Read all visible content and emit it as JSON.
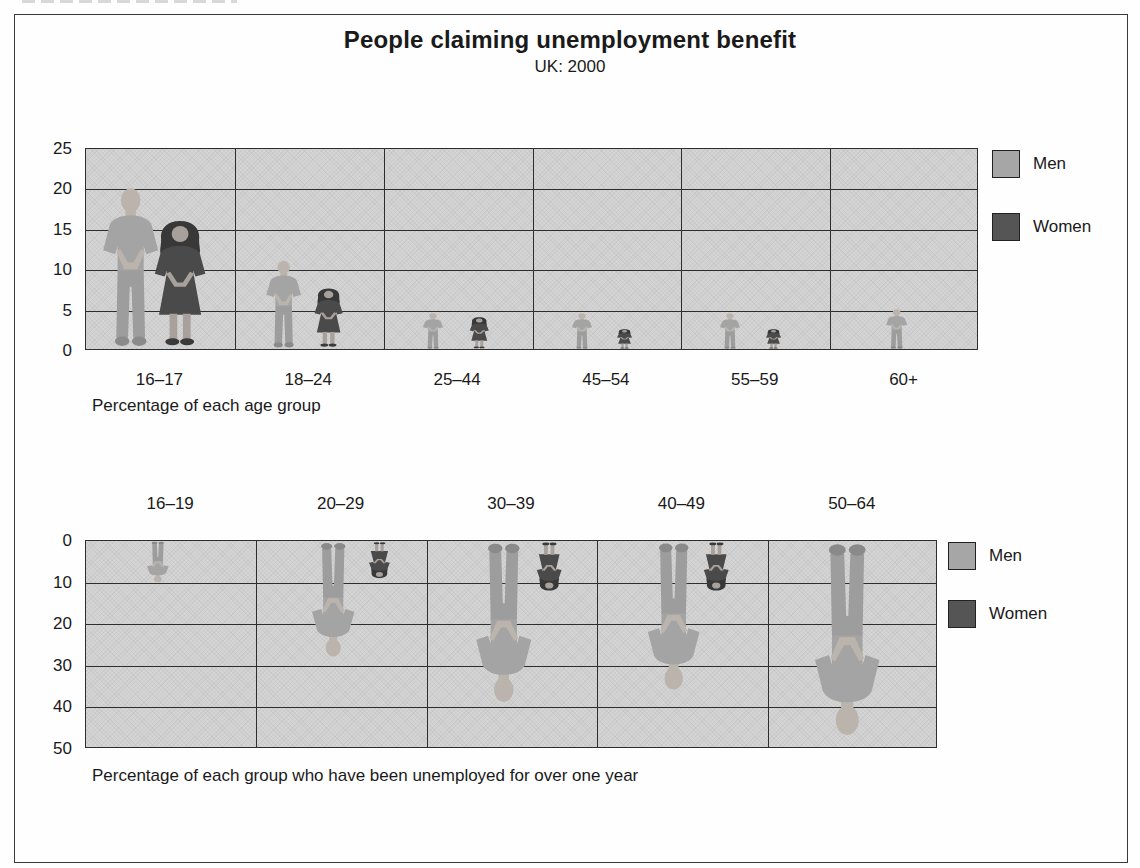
{
  "title": "People claiming unemployment benefit",
  "subtitle": "UK: 2000",
  "legend": {
    "men": "Men",
    "women": "Women"
  },
  "colors": {
    "men_body": "#a4a4a4",
    "men_skin": "#bab4ac",
    "men_pants": "#9d9d9d",
    "men_shoes": "#8a8a8a",
    "women_dress": "#4a4a4a",
    "women_hair": "#383838",
    "women_skin": "#a8a09a",
    "women_shoes": "#3a3a3a",
    "plot_background": "#d4d4d4",
    "gridline": "#2e2e2e",
    "legend_men_swatch": "#a6a6a6",
    "legend_women_swatch": "#555555",
    "text": "#1a1a1a"
  },
  "chart_data": [
    {
      "type": "bar",
      "subtype": "pictogram-people",
      "orientation": "up",
      "categories": [
        "16–17",
        "18–24",
        "25–44",
        "45–54",
        "55–59",
        "60+"
      ],
      "series": [
        {
          "name": "Men",
          "values": [
            20,
            11,
            4.5,
            4.5,
            4.5,
            5
          ]
        },
        {
          "name": "Women",
          "values": [
            16,
            7.5,
            4,
            2.5,
            2.5,
            null
          ]
        }
      ],
      "ylim": [
        0,
        25
      ],
      "yticks_top_to_bottom": [
        25,
        20,
        15,
        10,
        5,
        0
      ],
      "grid": true,
      "legend_position": "right",
      "caption": "Percentage of each age group"
    },
    {
      "type": "bar",
      "subtype": "pictogram-people",
      "orientation": "down",
      "categories": [
        "16–19",
        "20–29",
        "30–39",
        "40–49",
        "50–64"
      ],
      "series": [
        {
          "name": "Men",
          "values": [
            10,
            28,
            39,
            36,
            47
          ]
        },
        {
          "name": "Women",
          "values": [
            null,
            9,
            12,
            12,
            null
          ]
        }
      ],
      "ylim": [
        0,
        50
      ],
      "yticks_top_to_bottom": [
        0,
        10,
        20,
        30,
        40,
        50
      ],
      "grid": true,
      "legend_position": "right",
      "caption": "Percentage of each group who have been unemployed for over one year"
    }
  ]
}
